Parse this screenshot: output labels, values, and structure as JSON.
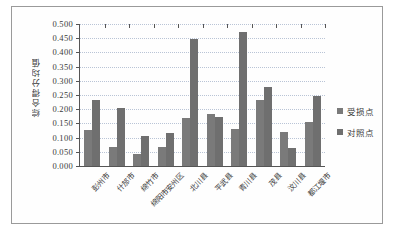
{
  "chart_data": {
    "type": "bar",
    "title": "",
    "xlabel": "",
    "ylabel": "综合得分均值",
    "ylim": [
      0.0,
      0.5
    ],
    "ytick_step": 0.05,
    "grid": true,
    "legend_position": "right",
    "categories": [
      "彭州市",
      "什邡市",
      "绵竹市",
      "绵阳市安州区",
      "北川县",
      "平武县",
      "青川县",
      "茂县",
      "汶川县",
      "都江堰市"
    ],
    "ytick_labels": [
      "0.500",
      "0.450",
      "0.400",
      "0.350",
      "0.300",
      "0.250",
      "0.200",
      "0.150",
      "0.100",
      "0.050",
      "0.000"
    ],
    "ytick_values": [
      0.5,
      0.45,
      0.4,
      0.35,
      0.3,
      0.25,
      0.2,
      0.15,
      0.1,
      0.05,
      0.0
    ],
    "series": [
      {
        "name": "受损点",
        "color": "#7a7a7a",
        "values": [
          0.127,
          0.068,
          0.042,
          0.066,
          0.169,
          0.182,
          0.131,
          0.232,
          0.12,
          0.156
        ]
      },
      {
        "name": "对照点",
        "color": "#6f6f6f",
        "values": [
          0.234,
          0.205,
          0.105,
          0.118,
          0.448,
          0.173,
          0.473,
          0.279,
          0.063,
          0.248
        ]
      }
    ]
  }
}
